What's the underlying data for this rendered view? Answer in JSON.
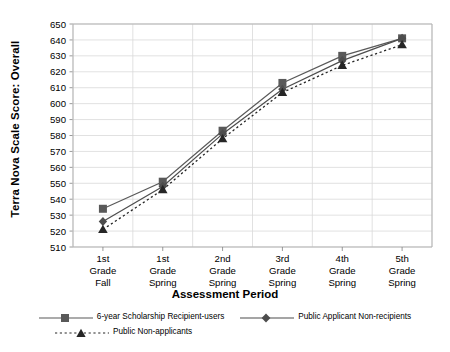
{
  "chart_data": {
    "type": "line",
    "title": "",
    "xlabel": "Assessment Period",
    "ylabel": "Terra Nova Scale Score: Overall",
    "categories": [
      "1st Grade Fall",
      "1st Grade Spring",
      "2nd Grade Spring",
      "3rd Grade Spring",
      "4th Grade Spring",
      "5th Grade Spring"
    ],
    "category_lines": [
      [
        "1st",
        "Grade",
        "Fall"
      ],
      [
        "1st",
        "Grade",
        "Spring"
      ],
      [
        "2nd",
        "Grade",
        "Spring"
      ],
      [
        "3rd",
        "Grade",
        "Spring"
      ],
      [
        "4th",
        "Grade",
        "Spring"
      ],
      [
        "5th",
        "Grade",
        "Spring"
      ]
    ],
    "ylim": [
      510,
      650
    ],
    "ytick_step": 10,
    "yticks": [
      510,
      520,
      530,
      540,
      550,
      560,
      570,
      580,
      590,
      600,
      610,
      620,
      630,
      640,
      650
    ],
    "grid": true,
    "legend_position": "bottom",
    "series": [
      {
        "name": "6-year Scholarship Recipient-users",
        "marker": "square",
        "dash": "solid",
        "color": "#595959",
        "values": [
          534,
          551,
          583,
          613,
          630,
          641
        ]
      },
      {
        "name": "Public Applicant Non-recipients",
        "marker": "diamond",
        "dash": "solid",
        "color": "#4d4d4d",
        "values": [
          526,
          548,
          581,
          609,
          627,
          641
        ]
      },
      {
        "name": "Public Non-applicants",
        "marker": "triangle",
        "dash": "dotted",
        "color": "#262626",
        "values": [
          521,
          546,
          578,
          607,
          624,
          637
        ]
      }
    ]
  },
  "legend": {
    "row1": [
      "6-year Scholarship Recipient-users",
      "Public Applicant Non-recipients"
    ],
    "row2": [
      "Public Non-applicants"
    ]
  }
}
